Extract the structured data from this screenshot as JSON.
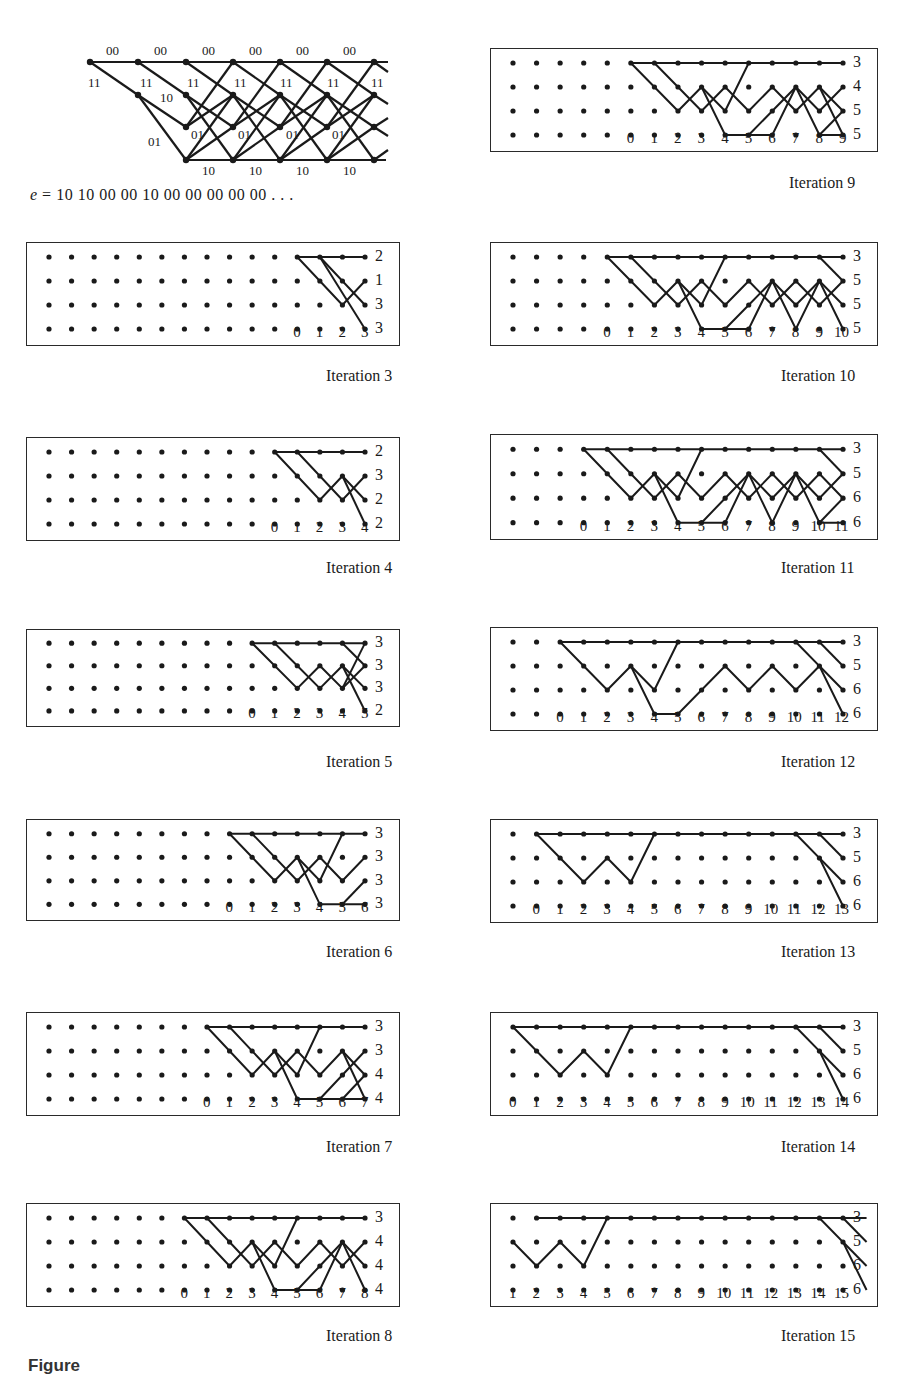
{
  "trellis": {
    "top_labels": [
      "00",
      "00",
      "00",
      "00",
      "00",
      "00"
    ],
    "upper_diag_labels": [
      "11",
      "11",
      "11",
      "11",
      "11",
      "11",
      "11"
    ],
    "mid_labels": [
      "10",
      "01"
    ],
    "lower_labels": [
      "01",
      "01",
      "01",
      "01"
    ],
    "bottom_labels": [
      "10",
      "10",
      "10",
      "10"
    ]
  },
  "error_sequence": {
    "prefix": "e",
    "equals": "=",
    "value": "10  10  00  00  10  00  00  00  00  00 . . ."
  },
  "panels": [
    {
      "id": "3",
      "caption": "Iteration 3",
      "first_col": 11,
      "total_cols": 15,
      "ticks": [
        "0",
        "1",
        "2",
        "3"
      ],
      "metrics": [
        "2",
        "1",
        "3",
        "3"
      ]
    },
    {
      "id": "4",
      "caption": "Iteration 4",
      "first_col": 10,
      "total_cols": 15,
      "ticks": [
        "0",
        "1",
        "2",
        "3",
        "4"
      ],
      "metrics": [
        "2",
        "3",
        "2",
        "2"
      ]
    },
    {
      "id": "5",
      "caption": "Iteration 5",
      "first_col": 9,
      "total_cols": 15,
      "ticks": [
        "0",
        "1",
        "2",
        "3",
        "4",
        "5"
      ],
      "metrics": [
        "3",
        "3",
        "3",
        "2"
      ]
    },
    {
      "id": "6",
      "caption": "Iteration 6",
      "first_col": 8,
      "total_cols": 15,
      "ticks": [
        "0",
        "1",
        "2",
        "3",
        "4",
        "5",
        "6"
      ],
      "metrics": [
        "3",
        "3",
        "3",
        "3"
      ]
    },
    {
      "id": "7",
      "caption": "Iteration 7",
      "first_col": 7,
      "total_cols": 15,
      "ticks": [
        "0",
        "1",
        "2",
        "3",
        "4",
        "5",
        "6",
        "7"
      ],
      "metrics": [
        "3",
        "3",
        "4",
        "4"
      ]
    },
    {
      "id": "8",
      "caption": "Iteration 8",
      "first_col": 6,
      "total_cols": 15,
      "ticks": [
        "0",
        "1",
        "2",
        "3",
        "4",
        "5",
        "6",
        "7",
        "8"
      ],
      "metrics": [
        "3",
        "4",
        "4",
        "4"
      ]
    },
    {
      "id": "9",
      "caption": "Iteration 9",
      "first_col": 5,
      "total_cols": 15,
      "ticks": [
        "0",
        "1",
        "2",
        "3",
        "4",
        "5",
        "6",
        "7",
        "8",
        "9"
      ],
      "metrics": [
        "3",
        "4",
        "5",
        "5"
      ]
    },
    {
      "id": "10",
      "caption": "Iteration 10",
      "first_col": 4,
      "total_cols": 15,
      "ticks": [
        "0",
        "1",
        "2",
        "3",
        "4",
        "5",
        "6",
        "7",
        "8",
        "9",
        "10"
      ],
      "metrics": [
        "3",
        "5",
        "5",
        "5"
      ]
    },
    {
      "id": "11",
      "caption": "Iteration 11",
      "first_col": 3,
      "total_cols": 15,
      "ticks": [
        "0",
        "1",
        "2",
        "3",
        "4",
        "5",
        "6",
        "7",
        "8",
        "9",
        "10",
        "11"
      ],
      "metrics": [
        "3",
        "5",
        "6",
        "6"
      ]
    },
    {
      "id": "12",
      "caption": "Iteration 12",
      "first_col": 2,
      "total_cols": 15,
      "ticks": [
        "0",
        "1",
        "2",
        "3",
        "4",
        "5",
        "6",
        "7",
        "8",
        "9",
        "10",
        "11",
        "12"
      ],
      "metrics": [
        "3",
        "5",
        "6",
        "6"
      ]
    },
    {
      "id": "13",
      "caption": "Iteration 13",
      "first_col": 1,
      "total_cols": 15,
      "ticks": [
        "0",
        "1",
        "2",
        "3",
        "4",
        "5",
        "6",
        "7",
        "8",
        "9",
        "10",
        "11",
        "12",
        "13"
      ],
      "metrics": [
        "3",
        "5",
        "6",
        "6"
      ]
    },
    {
      "id": "14",
      "caption": "Iteration 14",
      "first_col": 0,
      "total_cols": 15,
      "ticks": [
        "0",
        "1",
        "2",
        "3",
        "4",
        "5",
        "6",
        "7",
        "8",
        "9",
        "10",
        "11",
        "12",
        "13",
        "14"
      ],
      "metrics": [
        "3",
        "5",
        "6",
        "6"
      ]
    },
    {
      "id": "15",
      "caption": "Iteration 15",
      "first_col": 0,
      "total_cols": 15,
      "ticks": [
        "1",
        "2",
        "3",
        "4",
        "5",
        "6",
        "7",
        "8",
        "9",
        "10",
        "11",
        "12",
        "13",
        "14",
        "15"
      ],
      "metrics": [
        "3",
        "5",
        "6",
        "6"
      ]
    }
  ],
  "figure_label": "Figure"
}
